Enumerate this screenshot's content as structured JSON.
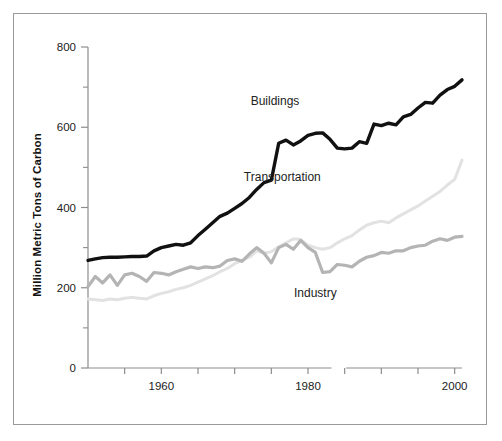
{
  "figure": {
    "background_color": "#ffffff",
    "border_color": "#9a9a9a"
  },
  "axes": {
    "y_axis_title": "Million Metric Tons of Carbon",
    "y_tick_labels": [
      "800",
      "600",
      "400",
      "200",
      "0"
    ],
    "x_tick_labels": [
      "1960",
      "1980",
      "2000"
    ]
  },
  "labels": {
    "buildings": "Buildings",
    "transportation": "Transportation",
    "industry": "Industry"
  },
  "chart_data": {
    "type": "line",
    "title": "",
    "xlabel": "",
    "ylabel": "Million Metric Tons of Carbon",
    "xlim": [
      1950,
      2001
    ],
    "ylim": [
      0,
      800
    ],
    "grid": false,
    "legend": "inline-labels",
    "y_major_ticks": [
      0,
      200,
      400,
      600,
      800
    ],
    "y_minor_ticks": [
      100,
      300,
      500,
      700
    ],
    "x_ticks": [
      1950,
      1955,
      1960,
      1965,
      1970,
      1975,
      1980,
      1985,
      1990,
      1995,
      2000
    ],
    "x": [
      1950,
      1951,
      1952,
      1953,
      1954,
      1955,
      1956,
      1957,
      1958,
      1959,
      1960,
      1961,
      1962,
      1963,
      1964,
      1965,
      1966,
      1967,
      1968,
      1969,
      1970,
      1971,
      1972,
      1973,
      1974,
      1975,
      1976,
      1977,
      1978,
      1979,
      1980,
      1981,
      1982,
      1983,
      1984,
      1985,
      1986,
      1987,
      1988,
      1989,
      1990,
      1991,
      1992,
      1993,
      1994,
      1995,
      1996,
      1997,
      1998,
      1999,
      2000,
      2001
    ],
    "series": [
      {
        "name": "Buildings",
        "color": "#111111",
        "line_width": 3.4,
        "values": [
          268,
          272,
          275,
          276,
          276,
          277,
          278,
          278,
          279,
          292,
          300,
          304,
          308,
          306,
          312,
          330,
          346,
          362,
          378,
          386,
          398,
          410,
          425,
          445,
          462,
          468,
          560,
          568,
          556,
          566,
          580,
          585,
          586,
          570,
          548,
          546,
          548,
          564,
          560,
          608,
          604,
          610,
          606,
          626,
          632,
          648,
          662,
          660,
          680,
          694,
          702,
          718
        ]
      },
      {
        "name": "Industry",
        "color": "#b4b4b4",
        "line_width": 3.2,
        "values": [
          203,
          228,
          212,
          232,
          206,
          232,
          236,
          228,
          216,
          238,
          236,
          232,
          240,
          246,
          252,
          248,
          252,
          250,
          254,
          268,
          272,
          266,
          284,
          300,
          286,
          262,
          300,
          308,
          296,
          318,
          300,
          288,
          238,
          240,
          258,
          256,
          252,
          266,
          276,
          280,
          288,
          286,
          292,
          292,
          300,
          304,
          306,
          316,
          322,
          318,
          326,
          328
        ]
      },
      {
        "name": "Transportation",
        "color": "#e2e2e2",
        "line_width": 3.0,
        "values": [
          172,
          170,
          168,
          172,
          170,
          174,
          176,
          174,
          172,
          180,
          186,
          190,
          196,
          200,
          206,
          214,
          222,
          230,
          240,
          248,
          260,
          268,
          276,
          292,
          286,
          290,
          302,
          312,
          322,
          320,
          306,
          300,
          296,
          300,
          312,
          322,
          330,
          344,
          356,
          362,
          366,
          362,
          374,
          384,
          394,
          404,
          416,
          428,
          440,
          456,
          470,
          518
        ]
      }
    ],
    "annotations": [
      {
        "text": "Buildings",
        "x": 1975.5,
        "y": 655
      },
      {
        "text": "Transportation",
        "x": 1976.5,
        "y": 465
      },
      {
        "text": "Industry",
        "x": 1981.0,
        "y": 178
      }
    ]
  }
}
